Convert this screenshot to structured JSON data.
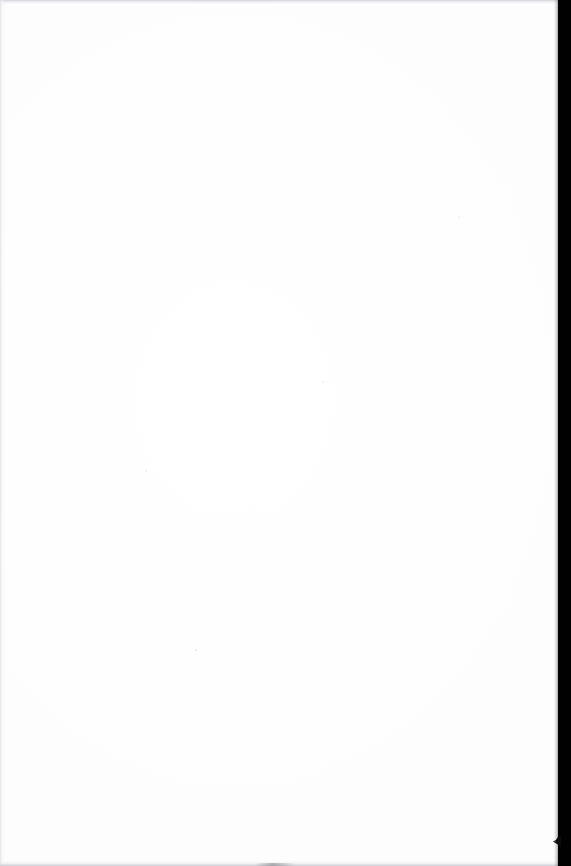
{
  "page": {
    "kind": "blank-scanned-page",
    "width_px": 571,
    "height_px": 866,
    "visible_text": "",
    "content_note": ""
  },
  "colors": {
    "paper_white": "#fefeff",
    "page_background": "#ffffff",
    "spine_black": "#010101",
    "edge_band_gray": "#ced1d5",
    "bottom_band_gray": "#c6c9ce",
    "left_band_gray": "#dddfe3",
    "dust_gray": "#a8aaaf"
  },
  "regions": {
    "paper_surface": {
      "name": "paper-surface",
      "x": 0,
      "y": 0,
      "width": 559,
      "height": 866
    },
    "spine_shadow": {
      "name": "spine-shadow",
      "x": 558,
      "y": 0,
      "width": 13,
      "height": 866
    },
    "edge_band_top": {
      "name": "edge-band-top",
      "x": 0,
      "y": 0,
      "width": 559,
      "height": 4
    },
    "edge_band_bottom": {
      "name": "edge-band-bottom",
      "x": 0,
      "y": 861,
      "width": 559,
      "height": 5
    },
    "edge_band_left": {
      "name": "edge-band-left",
      "x": 0,
      "y": 0,
      "width": 5,
      "height": 866
    },
    "corner_notch": {
      "name": "corner-notch",
      "x": 552,
      "y": 836,
      "width": 9,
      "height": 11
    }
  },
  "artifacts": {
    "dust_specks": [
      {
        "x": 195,
        "y": 649,
        "size": 2
      },
      {
        "x": 145,
        "y": 470,
        "size": 2
      },
      {
        "x": 322,
        "y": 381,
        "size": 2
      },
      {
        "x": 458,
        "y": 216,
        "size": 2
      }
    ]
  }
}
